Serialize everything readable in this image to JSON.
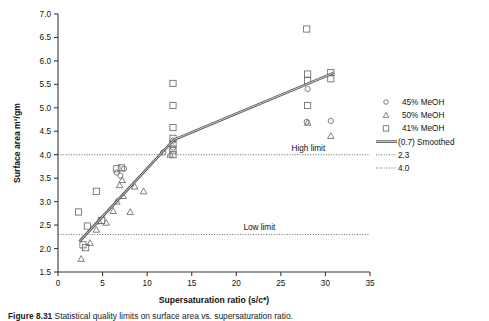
{
  "figure": {
    "caption_label": "Figure 8.31",
    "caption_text": "Statistical quality limits on surface area vs. supersaturation ratio."
  },
  "chart_data": {
    "type": "scatter",
    "title": "",
    "xlabel": "Supersaturation ratio (s/c*)",
    "ylabel": "Surface area m2/gm",
    "ylabel_display": "Surface area m²/gm",
    "xlim": [
      0,
      35
    ],
    "ylim": [
      1.5,
      7.0
    ],
    "xticks": [
      0,
      5,
      10,
      15,
      20,
      25,
      30,
      35
    ],
    "yticks": [
      1.5,
      2.0,
      2.5,
      3.0,
      3.5,
      4.0,
      4.5,
      5.0,
      5.5,
      6.0,
      6.5,
      7.0
    ],
    "grid": false,
    "legend_position": "right",
    "marker_color": "#6a6a6a",
    "line_color": "#555555",
    "series": [
      {
        "name": "45% MeOH",
        "marker": "circle",
        "points": [
          [
            6.6,
            3.62
          ],
          [
            7.4,
            3.7
          ],
          [
            7.0,
            3.55
          ],
          [
            11.8,
            4.05
          ],
          [
            12.9,
            4.3
          ],
          [
            12.9,
            4.15
          ],
          [
            27.9,
            4.7
          ],
          [
            28.0,
            5.4
          ],
          [
            30.6,
            4.72
          ]
        ]
      },
      {
        "name": "50% MeOH",
        "marker": "triangle",
        "points": [
          [
            2.6,
            1.78
          ],
          [
            3.6,
            2.12
          ],
          [
            4.3,
            2.4
          ],
          [
            4.6,
            2.58
          ],
          [
            5.4,
            2.55
          ],
          [
            6.2,
            2.8
          ],
          [
            6.6,
            3.0
          ],
          [
            6.9,
            3.35
          ],
          [
            7.2,
            3.46
          ],
          [
            7.3,
            3.12
          ],
          [
            8.1,
            2.78
          ],
          [
            8.6,
            3.32
          ],
          [
            9.6,
            3.22
          ],
          [
            12.6,
            4.0
          ],
          [
            28.0,
            4.68
          ],
          [
            30.6,
            4.4
          ]
        ]
      },
      {
        "name": "41% MeOH",
        "marker": "square",
        "points": [
          [
            2.3,
            2.78
          ],
          [
            2.8,
            2.08
          ],
          [
            3.1,
            2.02
          ],
          [
            3.3,
            2.48
          ],
          [
            4.3,
            3.22
          ],
          [
            4.9,
            2.6
          ],
          [
            6.6,
            3.7
          ],
          [
            7.1,
            3.72
          ],
          [
            12.9,
            5.52
          ],
          [
            12.9,
            5.05
          ],
          [
            12.9,
            4.58
          ],
          [
            12.9,
            4.35
          ],
          [
            12.9,
            4.22
          ],
          [
            12.9,
            4.1
          ],
          [
            12.9,
            4.0
          ],
          [
            27.9,
            6.68
          ],
          [
            28.0,
            5.72
          ],
          [
            28.0,
            5.58
          ],
          [
            28.0,
            5.05
          ],
          [
            30.6,
            5.75
          ],
          [
            30.6,
            5.62
          ]
        ]
      }
    ],
    "smoothed_line": {
      "name": "(0.7) Smoothed",
      "points": [
        [
          2.4,
          2.15
        ],
        [
          13.0,
          4.32
        ],
        [
          31.0,
          5.75
        ]
      ]
    },
    "reference_lines": [
      {
        "name": "High limit",
        "value": 4.0,
        "label": "High limit",
        "legend": "4.0"
      },
      {
        "name": "Low limit",
        "value": 2.3,
        "label": "Low limit",
        "legend": "2.3"
      }
    ],
    "legend": [
      {
        "label": "45% MeOH",
        "marker": "circle"
      },
      {
        "label": "50% MeOH",
        "marker": "triangle"
      },
      {
        "label": "41% MeOH",
        "marker": "square"
      },
      {
        "label": "(0.7) Smoothed",
        "marker": "line"
      },
      {
        "label": "2.3",
        "marker": "dotted"
      },
      {
        "label": "4.0",
        "marker": "dotted"
      }
    ]
  }
}
